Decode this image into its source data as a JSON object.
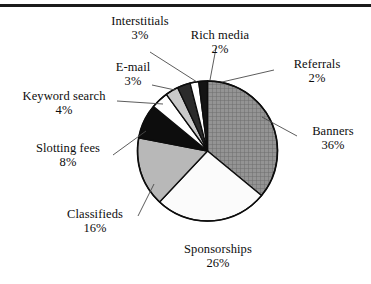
{
  "chart_data": {
    "type": "pie",
    "title": "",
    "subtitle": "",
    "xlabel": "",
    "ylabel": "",
    "legend_position": "none",
    "grid": false,
    "labels_outside": true,
    "units": "%",
    "total": 100,
    "categories": [
      "Banners",
      "Sponsorships",
      "Classifieds",
      "Slotting fees",
      "Keyword search",
      "E-mail",
      "Interstitials",
      "Rich media",
      "Referrals"
    ],
    "values": [
      36,
      26,
      16,
      8,
      4,
      3,
      3,
      2,
      2
    ],
    "slices": [
      {
        "name": "Banners",
        "label": "Banners",
        "value": 36,
        "value_label": "36%",
        "fill": "#8f8f8f",
        "pattern": "crosshatch-grid",
        "start_angle": 0,
        "end_angle": 129.6
      },
      {
        "name": "Sponsorships",
        "label": "Sponsorships",
        "value": 26,
        "value_label": "26%",
        "fill": "#fbfbfb",
        "pattern": "solid-light",
        "start_angle": 129.6,
        "end_angle": 223.2
      },
      {
        "name": "Classifieds",
        "label": "Classifieds",
        "value": 16,
        "value_label": "16%",
        "fill": "#b8b8b8",
        "pattern": "solid-gray",
        "start_angle": 223.2,
        "end_angle": 280.8
      },
      {
        "name": "Slotting fees",
        "label": "Slotting fees",
        "value": 8,
        "value_label": "8%",
        "fill": "#0d0d0d",
        "pattern": "solid-black",
        "start_angle": 280.8,
        "end_angle": 309.6
      },
      {
        "name": "Keyword search",
        "label": "Keyword search",
        "value": 4,
        "value_label": "4%",
        "fill": "#ffffff",
        "pattern": "solid-white",
        "start_angle": 309.6,
        "end_angle": 324.0
      },
      {
        "name": "E-mail",
        "label": "E-mail",
        "value": 3,
        "value_label": "3%",
        "fill": "#c9c9c9",
        "pattern": "solid-gray",
        "start_angle": 324.0,
        "end_angle": 334.8
      },
      {
        "name": "Interstitials",
        "label": "Interstitials",
        "value": 3,
        "value_label": "3%",
        "fill": "#2b2b2b",
        "pattern": "solid-dark",
        "start_angle": 334.8,
        "end_angle": 345.6
      },
      {
        "name": "Rich media",
        "label": "Rich media",
        "value": 2,
        "value_label": "2%",
        "fill": "#ffffff",
        "pattern": "solid-white",
        "start_angle": 345.6,
        "end_angle": 352.8
      },
      {
        "name": "Referrals",
        "label": "Referrals",
        "value": 2,
        "value_label": "2%",
        "fill": "#141414",
        "pattern": "solid-black",
        "start_angle": 352.8,
        "end_angle": 360.0
      }
    ]
  },
  "labels": {
    "interstitials": {
      "name": "Interstitials",
      "pct": "3%"
    },
    "rich_media": {
      "name": "Rich media",
      "pct": "2%"
    },
    "referrals": {
      "name": "Referrals",
      "pct": "2%"
    },
    "email": {
      "name": "E-mail",
      "pct": "3%"
    },
    "banners": {
      "name": "Banners",
      "pct": "36%"
    },
    "keyword": {
      "name": "Keyword search",
      "pct": "4%"
    },
    "slotting": {
      "name": "Slotting fees",
      "pct": "8%"
    },
    "classifieds": {
      "name": "Classifieds",
      "pct": "16%"
    },
    "sponsorships": {
      "name": "Sponsorships",
      "pct": "26%"
    }
  },
  "colors": {
    "outline": "#0d0d0d",
    "rule": "#1b1b1b",
    "background": "#ffffff",
    "text": "#0d0d0d"
  }
}
